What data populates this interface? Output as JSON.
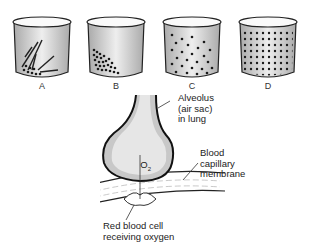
{
  "beakers": [
    {
      "id": "A",
      "label": "A",
      "state": "crystals and few dissolved particles at bottom"
    },
    {
      "id": "B",
      "label": "B",
      "state": "particles clustered in lower left"
    },
    {
      "id": "C",
      "label": "C",
      "state": "particles spreading out"
    },
    {
      "id": "D",
      "label": "D",
      "state": "particles evenly distributed"
    }
  ],
  "alveolus_diagram": {
    "gas_label": "O",
    "gas_subscript": "2",
    "labels": {
      "alveolus": "Alveolus\n(air sac)\nin lung",
      "membrane": "Blood\ncapillary\nmembrane",
      "rbc": "Red blood cell\nreceiving oxygen"
    }
  },
  "colors": {
    "beaker_fill": "#d8d8d8",
    "beaker_outline": "#222222",
    "particle": "#1a1a1a",
    "alveolus_fill": "#c8c8c8"
  }
}
